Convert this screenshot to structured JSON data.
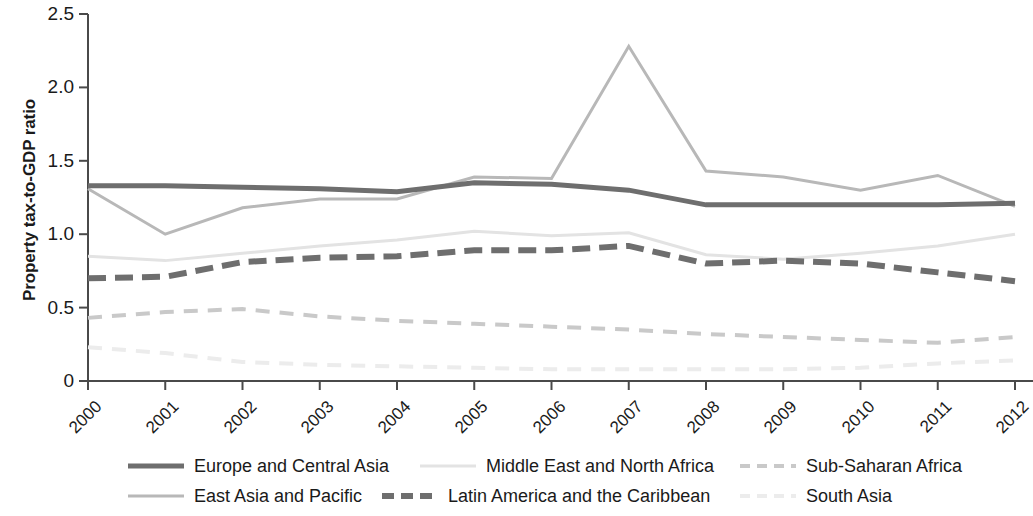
{
  "chart_data": {
    "type": "line",
    "title": "",
    "xlabel": "",
    "ylabel": "Property tax-to-GDP ratio",
    "categories": [
      "2000",
      "2001",
      "2002",
      "2003",
      "2004",
      "2005",
      "2006",
      "2007",
      "2008",
      "2009",
      "2010",
      "2011",
      "2012"
    ],
    "x": [
      2000,
      2001,
      2002,
      2003,
      2004,
      2005,
      2006,
      2007,
      2008,
      2009,
      2010,
      2011,
      2012
    ],
    "ylim": [
      0,
      2.5
    ],
    "yticks": [
      0,
      0.5,
      1.0,
      1.5,
      2.0,
      2.5
    ],
    "ytick_labels": [
      "0",
      "0.5",
      "1.0",
      "1.5",
      "2.0",
      "2.5"
    ],
    "grid": false,
    "legend_position": "bottom",
    "series": [
      {
        "name": "Europe and Central Asia",
        "color": "#6e6e6e",
        "width": 5,
        "dash": "none",
        "values": [
          1.33,
          1.33,
          1.32,
          1.31,
          1.29,
          1.35,
          1.34,
          1.3,
          1.2,
          1.2,
          1.2,
          1.2,
          1.21
        ]
      },
      {
        "name": "East Asia and Pacific",
        "color": "#b8b8b8",
        "width": 3,
        "dash": "none",
        "values": [
          1.31,
          1.0,
          1.18,
          1.24,
          1.24,
          1.39,
          1.38,
          2.28,
          1.43,
          1.39,
          1.3,
          1.4,
          1.19
        ]
      },
      {
        "name": "Middle East and North Africa",
        "color": "#e3e3e3",
        "width": 3,
        "dash": "none",
        "values": [
          0.85,
          0.82,
          0.87,
          0.92,
          0.96,
          1.02,
          0.99,
          1.01,
          0.86,
          0.83,
          0.87,
          0.92,
          1.0
        ]
      },
      {
        "name": "Latin America and the Caribbean",
        "color": "#6e6e6e",
        "width": 6,
        "dash": "18 9",
        "values": [
          0.7,
          0.71,
          0.81,
          0.84,
          0.85,
          0.89,
          0.89,
          0.92,
          0.8,
          0.82,
          0.8,
          0.74,
          0.68
        ]
      },
      {
        "name": "Sub-Saharan Africa",
        "color": "#c9c9c9",
        "width": 4,
        "dash": "14 10",
        "values": [
          0.43,
          0.47,
          0.49,
          0.44,
          0.41,
          0.39,
          0.37,
          0.35,
          0.32,
          0.3,
          0.28,
          0.26,
          0.3
        ]
      },
      {
        "name": "South Asia",
        "color": "#ececec",
        "width": 4,
        "dash": "14 10",
        "values": [
          0.23,
          0.19,
          0.13,
          0.11,
          0.1,
          0.09,
          0.08,
          0.08,
          0.08,
          0.08,
          0.09,
          0.12,
          0.14
        ]
      }
    ]
  },
  "axis": {
    "ylabel": "Property tax-to-GDP ratio",
    "ytick_labels": [
      "2.5",
      "2.0",
      "1.5",
      "1.0",
      "0.5",
      "0"
    ],
    "xtick_labels": [
      "2000",
      "2001",
      "2002",
      "2003",
      "2004",
      "2005",
      "2006",
      "2007",
      "2008",
      "2009",
      "2010",
      "2011",
      "2012"
    ]
  },
  "legend": {
    "row1": [
      {
        "label": "Europe and Central Asia",
        "color": "#6e6e6e",
        "width": 5,
        "dash": "none"
      },
      {
        "label": "Middle East and North Africa",
        "color": "#e3e3e3",
        "width": 3,
        "dash": "none"
      },
      {
        "label": "Sub-Saharan Africa",
        "color": "#c9c9c9",
        "width": 4,
        "dash": "10 7"
      }
    ],
    "row2": [
      {
        "label": "East Asia and Pacific",
        "color": "#b8b8b8",
        "width": 3,
        "dash": "none"
      },
      {
        "label": "Latin America and the Caribbean",
        "color": "#6e6e6e",
        "width": 6,
        "dash": "12 7"
      },
      {
        "label": "South Asia",
        "color": "#ececec",
        "width": 4,
        "dash": "10 7"
      }
    ]
  }
}
